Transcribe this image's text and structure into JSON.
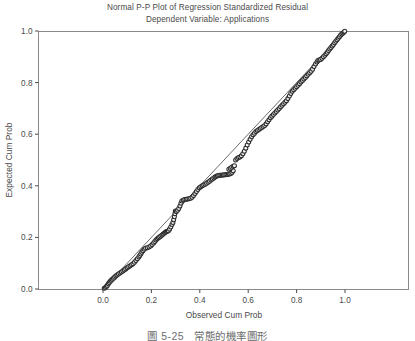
{
  "figure": {
    "title_line1": "Normal P-P Plot of Regression Standardized Residual",
    "title_line2": "Dependent Variable: Applications",
    "caption_number": "圖 5-25",
    "caption_text": "常態的機率圖形",
    "background_color": "#ffffff",
    "ink_color": "#4a4a4a",
    "marker_color": "#2b2b2b",
    "line_color": "#5a5a5a"
  },
  "chart_data": {
    "type": "scatter",
    "title": "Normal P-P Plot of Regression Standardized Residual",
    "subtitle": "Dependent Variable: Applications",
    "xlabel": "Observed Cum Prob",
    "ylabel": "Expected Cum Prob",
    "xlim": [
      0.0,
      1.0
    ],
    "ylim": [
      0.0,
      1.0
    ],
    "xticks": [
      0.0,
      0.2,
      0.4,
      0.6,
      0.8,
      1.0
    ],
    "yticks": [
      0.0,
      0.2,
      0.4,
      0.6,
      0.8,
      1.0
    ],
    "xtick_labels": [
      "0.0",
      "0.2",
      "0.4",
      "0.6",
      "0.8",
      "1.0"
    ],
    "ytick_labels": [
      "0.0",
      "0.2",
      "0.4",
      "0.6",
      "0.8",
      "1.0"
    ],
    "grid": false,
    "legend": false,
    "reference_line": {
      "name": "diagonal-reference-line",
      "x": [
        0.0,
        1.0
      ],
      "y": [
        0.0,
        1.0
      ]
    },
    "series": [
      {
        "name": "Standardized Residual",
        "marker": "open-circle",
        "points": [
          [
            0.005,
            0.003
          ],
          [
            0.01,
            0.006
          ],
          [
            0.014,
            0.01
          ],
          [
            0.018,
            0.014
          ],
          [
            0.022,
            0.02
          ],
          [
            0.026,
            0.025
          ],
          [
            0.03,
            0.03
          ],
          [
            0.034,
            0.034
          ],
          [
            0.038,
            0.038
          ],
          [
            0.043,
            0.042
          ],
          [
            0.048,
            0.046
          ],
          [
            0.053,
            0.05
          ],
          [
            0.058,
            0.054
          ],
          [
            0.064,
            0.058
          ],
          [
            0.07,
            0.062
          ],
          [
            0.076,
            0.066
          ],
          [
            0.082,
            0.07
          ],
          [
            0.088,
            0.074
          ],
          [
            0.094,
            0.078
          ],
          [
            0.1,
            0.082
          ],
          [
            0.106,
            0.086
          ],
          [
            0.112,
            0.09
          ],
          [
            0.118,
            0.094
          ],
          [
            0.124,
            0.098
          ],
          [
            0.13,
            0.104
          ],
          [
            0.136,
            0.11
          ],
          [
            0.142,
            0.117
          ],
          [
            0.148,
            0.124
          ],
          [
            0.152,
            0.13
          ],
          [
            0.156,
            0.136
          ],
          [
            0.16,
            0.142
          ],
          [
            0.165,
            0.148
          ],
          [
            0.17,
            0.154
          ],
          [
            0.176,
            0.158
          ],
          [
            0.183,
            0.16
          ],
          [
            0.19,
            0.163
          ],
          [
            0.197,
            0.167
          ],
          [
            0.203,
            0.172
          ],
          [
            0.209,
            0.178
          ],
          [
            0.214,
            0.184
          ],
          [
            0.219,
            0.19
          ],
          [
            0.224,
            0.195
          ],
          [
            0.229,
            0.199
          ],
          [
            0.234,
            0.202
          ],
          [
            0.239,
            0.205
          ],
          [
            0.244,
            0.209
          ],
          [
            0.249,
            0.213
          ],
          [
            0.254,
            0.217
          ],
          [
            0.258,
            0.22
          ],
          [
            0.262,
            0.223
          ],
          [
            0.266,
            0.224
          ],
          [
            0.27,
            0.226
          ],
          [
            0.275,
            0.232
          ],
          [
            0.28,
            0.24
          ],
          [
            0.285,
            0.25
          ],
          [
            0.289,
            0.258
          ],
          [
            0.292,
            0.268
          ],
          [
            0.295,
            0.28
          ],
          [
            0.297,
            0.292
          ],
          [
            0.299,
            0.302
          ],
          [
            0.303,
            0.3
          ],
          [
            0.308,
            0.305
          ],
          [
            0.313,
            0.312
          ],
          [
            0.318,
            0.322
          ],
          [
            0.322,
            0.332
          ],
          [
            0.326,
            0.341
          ],
          [
            0.332,
            0.345
          ],
          [
            0.338,
            0.347
          ],
          [
            0.344,
            0.348
          ],
          [
            0.35,
            0.349
          ],
          [
            0.356,
            0.35
          ],
          [
            0.362,
            0.352
          ],
          [
            0.368,
            0.356
          ],
          [
            0.374,
            0.362
          ],
          [
            0.38,
            0.37
          ],
          [
            0.386,
            0.378
          ],
          [
            0.392,
            0.386
          ],
          [
            0.398,
            0.392
          ],
          [
            0.404,
            0.396
          ],
          [
            0.41,
            0.4
          ],
          [
            0.416,
            0.403
          ],
          [
            0.422,
            0.406
          ],
          [
            0.428,
            0.41
          ],
          [
            0.434,
            0.414
          ],
          [
            0.44,
            0.418
          ],
          [
            0.446,
            0.422
          ],
          [
            0.452,
            0.426
          ],
          [
            0.458,
            0.43
          ],
          [
            0.463,
            0.434
          ],
          [
            0.468,
            0.437
          ],
          [
            0.473,
            0.439
          ],
          [
            0.478,
            0.44
          ],
          [
            0.483,
            0.441
          ],
          [
            0.488,
            0.441
          ],
          [
            0.493,
            0.442
          ],
          [
            0.498,
            0.442
          ],
          [
            0.503,
            0.443
          ],
          [
            0.508,
            0.443
          ],
          [
            0.513,
            0.444
          ],
          [
            0.518,
            0.445
          ],
          [
            0.523,
            0.446
          ],
          [
            0.528,
            0.448
          ],
          [
            0.533,
            0.452
          ],
          [
            0.538,
            0.458
          ],
          [
            0.52,
            0.464
          ],
          [
            0.526,
            0.468
          ],
          [
            0.532,
            0.472
          ],
          [
            0.538,
            0.476
          ],
          [
            0.543,
            0.478
          ],
          [
            0.548,
            0.5
          ],
          [
            0.554,
            0.506
          ],
          [
            0.56,
            0.51
          ],
          [
            0.566,
            0.512
          ],
          [
            0.572,
            0.516
          ],
          [
            0.578,
            0.524
          ],
          [
            0.584,
            0.534
          ],
          [
            0.59,
            0.546
          ],
          [
            0.596,
            0.558
          ],
          [
            0.602,
            0.57
          ],
          [
            0.608,
            0.58
          ],
          [
            0.614,
            0.59
          ],
          [
            0.62,
            0.598
          ],
          [
            0.626,
            0.604
          ],
          [
            0.632,
            0.61
          ],
          [
            0.638,
            0.614
          ],
          [
            0.644,
            0.618
          ],
          [
            0.65,
            0.622
          ],
          [
            0.656,
            0.626
          ],
          [
            0.662,
            0.63
          ],
          [
            0.668,
            0.634
          ],
          [
            0.674,
            0.64
          ],
          [
            0.68,
            0.648
          ],
          [
            0.686,
            0.656
          ],
          [
            0.692,
            0.664
          ],
          [
            0.698,
            0.67
          ],
          [
            0.704,
            0.676
          ],
          [
            0.71,
            0.682
          ],
          [
            0.716,
            0.688
          ],
          [
            0.722,
            0.694
          ],
          [
            0.728,
            0.7
          ],
          [
            0.734,
            0.706
          ],
          [
            0.74,
            0.712
          ],
          [
            0.746,
            0.718
          ],
          [
            0.752,
            0.724
          ],
          [
            0.758,
            0.73
          ],
          [
            0.764,
            0.738
          ],
          [
            0.77,
            0.748
          ],
          [
            0.776,
            0.758
          ],
          [
            0.782,
            0.766
          ],
          [
            0.788,
            0.772
          ],
          [
            0.794,
            0.778
          ],
          [
            0.8,
            0.784
          ],
          [
            0.806,
            0.79
          ],
          [
            0.812,
            0.796
          ],
          [
            0.818,
            0.802
          ],
          [
            0.824,
            0.808
          ],
          [
            0.83,
            0.814
          ],
          [
            0.836,
            0.82
          ],
          [
            0.842,
            0.826
          ],
          [
            0.848,
            0.832
          ],
          [
            0.854,
            0.838
          ],
          [
            0.86,
            0.844
          ],
          [
            0.866,
            0.852
          ],
          [
            0.872,
            0.862
          ],
          [
            0.878,
            0.872
          ],
          [
            0.884,
            0.88
          ],
          [
            0.888,
            0.886
          ],
          [
            0.893,
            0.888
          ],
          [
            0.899,
            0.89
          ],
          [
            0.905,
            0.894
          ],
          [
            0.911,
            0.9
          ],
          [
            0.917,
            0.906
          ],
          [
            0.922,
            0.912
          ],
          [
            0.927,
            0.918
          ],
          [
            0.932,
            0.924
          ],
          [
            0.937,
            0.93
          ],
          [
            0.942,
            0.936
          ],
          [
            0.947,
            0.942
          ],
          [
            0.952,
            0.948
          ],
          [
            0.957,
            0.954
          ],
          [
            0.962,
            0.96
          ],
          [
            0.967,
            0.966
          ],
          [
            0.972,
            0.972
          ],
          [
            0.977,
            0.978
          ],
          [
            0.982,
            0.984
          ],
          [
            0.987,
            0.988
          ],
          [
            0.992,
            0.992
          ],
          [
            0.996,
            0.996
          ],
          [
            0.999,
            0.999
          ]
        ]
      }
    ]
  }
}
